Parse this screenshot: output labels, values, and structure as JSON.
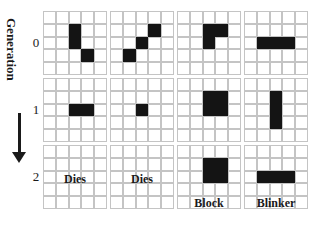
{
  "axis": {
    "title": "Generation",
    "generations": [
      "0",
      "1",
      "2"
    ]
  },
  "colors": {
    "live_cell": "#141414",
    "grid_line": "#c4c4c4"
  },
  "grid_size": 5,
  "patterns": [
    {
      "name": "pattern-1",
      "caption": "",
      "generations": [
        {
          "gen": 0,
          "live": [
            [
              1,
              2
            ],
            [
              2,
              2
            ],
            [
              3,
              3
            ]
          ]
        },
        {
          "gen": 1,
          "live": [
            [
              2,
              2
            ],
            [
              2,
              3
            ]
          ]
        },
        {
          "gen": 2,
          "live": [],
          "label": "Dies"
        }
      ]
    },
    {
      "name": "pattern-2",
      "caption": "",
      "generations": [
        {
          "gen": 0,
          "live": [
            [
              1,
              3
            ],
            [
              2,
              2
            ],
            [
              3,
              1
            ]
          ]
        },
        {
          "gen": 1,
          "live": [
            [
              2,
              2
            ]
          ]
        },
        {
          "gen": 2,
          "live": [],
          "label": "Dies"
        }
      ]
    },
    {
      "name": "pattern-3",
      "caption": "Block",
      "generations": [
        {
          "gen": 0,
          "live": [
            [
              1,
              2
            ],
            [
              1,
              3
            ],
            [
              2,
              2
            ]
          ]
        },
        {
          "gen": 1,
          "live": [
            [
              1,
              2
            ],
            [
              1,
              3
            ],
            [
              2,
              2
            ],
            [
              2,
              3
            ]
          ]
        },
        {
          "gen": 2,
          "live": [
            [
              1,
              2
            ],
            [
              1,
              3
            ],
            [
              2,
              2
            ],
            [
              2,
              3
            ]
          ],
          "label": "Block"
        }
      ]
    },
    {
      "name": "pattern-4",
      "caption": "Blinker",
      "generations": [
        {
          "gen": 0,
          "live": [
            [
              2,
              1
            ],
            [
              2,
              2
            ],
            [
              2,
              3
            ]
          ]
        },
        {
          "gen": 1,
          "live": [
            [
              1,
              2
            ],
            [
              2,
              2
            ],
            [
              3,
              2
            ]
          ]
        },
        {
          "gen": 2,
          "live": [
            [
              2,
              1
            ],
            [
              2,
              2
            ],
            [
              2,
              3
            ]
          ],
          "label": "Blinker"
        }
      ]
    }
  ],
  "labels": {
    "p1_g2": "Dies",
    "p2_g2": "Dies",
    "p3_g2": "Block",
    "p4_g2": "Blinker"
  }
}
